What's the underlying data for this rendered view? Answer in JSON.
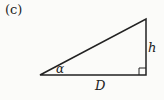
{
  "figure": {
    "panel_label": "(c)",
    "labels": {
      "height": "h",
      "angle": "α",
      "base": "D"
    },
    "shape": "right-triangle",
    "stroke_color": "#222222",
    "background_color": "#fbfbf9"
  }
}
